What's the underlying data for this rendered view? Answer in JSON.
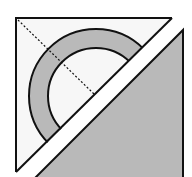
{
  "icon": {
    "name": "split-square-protractor-icon",
    "colors": {
      "background": "#ffffff",
      "left_fill": "#f7f7f7",
      "grey_fill": "#b9b9b9",
      "stroke": "#111111"
    }
  }
}
